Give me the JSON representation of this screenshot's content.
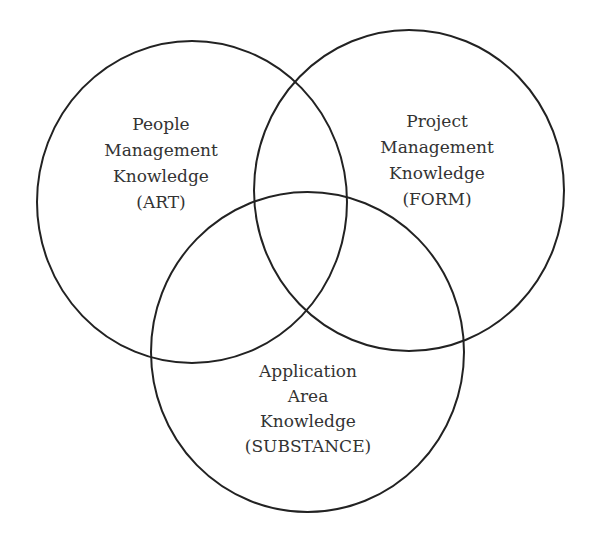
{
  "diagram": {
    "type": "venn",
    "circles": [
      {
        "id": "people",
        "lines": [
          "People",
          "Management",
          "Knowledge",
          "(ART)"
        ],
        "center": [
          192,
          202
        ],
        "radius": [
          155,
          161
        ]
      },
      {
        "id": "project",
        "lines": [
          "Project",
          "Management",
          "Knowledge",
          "(FORM)"
        ],
        "center": [
          409,
          190.5
        ],
        "radius": [
          155,
          160.5
        ]
      },
      {
        "id": "application",
        "lines": [
          "Application",
          "Area",
          "Knowledge",
          "(SUBSTANCE)"
        ],
        "center": [
          307.5,
          352
        ],
        "radius": [
          156.5,
          160
        ]
      }
    ],
    "colors": {
      "stroke": "#222222",
      "text": "#333333",
      "background": "#ffffff"
    }
  }
}
